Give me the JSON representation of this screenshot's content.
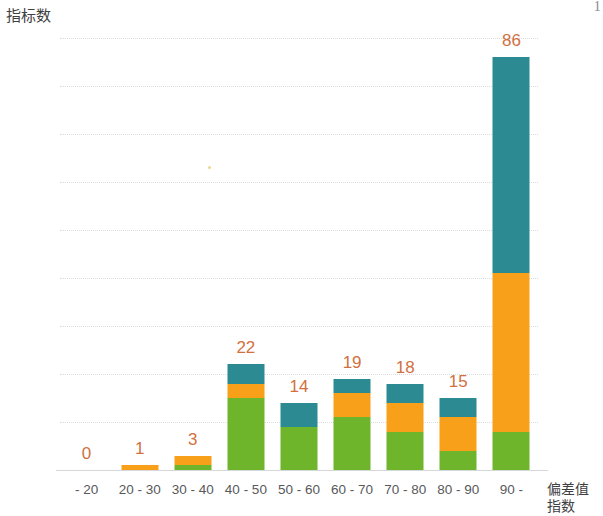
{
  "page_artifact": "1",
  "axes": {
    "y_title": "指标数",
    "x_title_line1": "偏差值",
    "x_title_line2": "指数"
  },
  "y_ticks": [
    "0",
    "10",
    "20",
    "30",
    "40",
    "50",
    "60",
    "70",
    "80",
    "90"
  ],
  "colors": {
    "green": "#6fb52b",
    "orange": "#f9a01b",
    "teal": "#2b8a92",
    "label": "#d1703f",
    "tick_text": "#58595b",
    "gridline": "#dcdcdc",
    "background": "#ffffff"
  },
  "chart_data": {
    "type": "bar",
    "subtype": "stacked-bar",
    "title": "",
    "xlabel": "偏差值指数",
    "ylabel": "指标数",
    "ylim": [
      0,
      90
    ],
    "ytick_step": 10,
    "grid": true,
    "legend": "none",
    "categories": [
      "- 20",
      "20 - 30",
      "30 - 40",
      "40 - 50",
      "50 - 60",
      "60 - 70",
      "70 - 80",
      "80 - 90",
      "90 -"
    ],
    "series": [
      {
        "name": "green",
        "color": "#6fb52b",
        "values": [
          0,
          0,
          1,
          15,
          9,
          11,
          8,
          4,
          8
        ]
      },
      {
        "name": "orange",
        "color": "#f9a01b",
        "values": [
          0,
          1,
          2,
          3,
          0,
          5,
          6,
          7,
          33
        ]
      },
      {
        "name": "teal",
        "color": "#2b8a92",
        "values": [
          0,
          0,
          0,
          4,
          5,
          3,
          4,
          4,
          45
        ]
      }
    ],
    "totals": [
      0,
      1,
      3,
      22,
      14,
      19,
      18,
      15,
      86
    ],
    "data_labels": [
      "0",
      "1",
      "3",
      "22",
      "14",
      "19",
      "18",
      "15",
      "86"
    ]
  }
}
